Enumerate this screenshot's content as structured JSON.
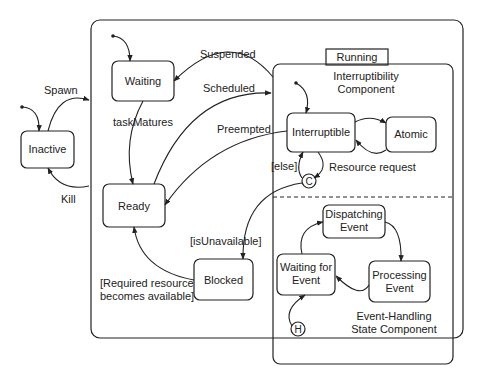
{
  "diagram": {
    "type": "state-machine",
    "colors": {
      "line": "#222222",
      "background": "#ffffff"
    },
    "states": {
      "inactive": "Inactive",
      "waiting": "Waiting",
      "ready": "Ready",
      "blocked": "Blocked",
      "running": "Running",
      "interruptible": "Interruptible",
      "atomic": "Atomic",
      "dispatching_1": "Dispatching",
      "dispatching_2": "Event",
      "waiting_event_1": "Waiting for",
      "waiting_event_2": "Event",
      "processing_1": "Processing",
      "processing_2": "Event"
    },
    "regions": {
      "interruptibility_1": "Interruptibility",
      "interruptibility_2": "Component",
      "event_handling_1": "Event-Handling",
      "event_handling_2": "State Component"
    },
    "pseudostates": {
      "choice": "C",
      "history": "H"
    },
    "transitions": {
      "spawn": "Spawn",
      "kill": "Kill",
      "suspended": "Suspended",
      "scheduled": "Scheduled",
      "task_matures": "taskMatures",
      "preempted": "Preempted",
      "else_guard": "[else]",
      "resource_request": "Resource request",
      "is_unavailable": "[isUnavailable]",
      "resource_available_1": "[Required resource",
      "resource_available_2": "becomes available]"
    }
  }
}
